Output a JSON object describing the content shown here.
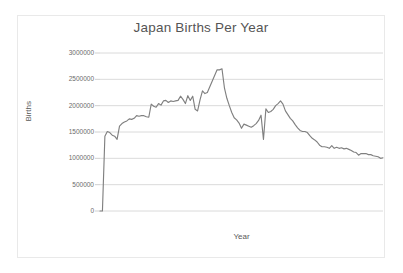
{
  "chart_data": {
    "type": "line",
    "title": "Japan Births Per Year",
    "xlabel": "Year",
    "ylabel": "Births",
    "ylim": [
      0,
      3000000
    ],
    "xlim": [
      1899,
      2015
    ],
    "grid": true,
    "legend": false,
    "legend_position": "none",
    "y_ticks": [
      0,
      500000,
      1000000,
      1500000,
      2000000,
      2500000,
      3000000
    ],
    "y_tick_labels": [
      "0",
      "500000",
      "1000000",
      "1500000",
      "2000000",
      "2500000",
      "3000000"
    ],
    "x_tick_labels": [],
    "line_color": "#808080",
    "series": [
      {
        "name": "Births",
        "x": [
          1899,
          1900,
          1901,
          1902,
          1903,
          1904,
          1905,
          1906,
          1907,
          1908,
          1909,
          1910,
          1911,
          1912,
          1913,
          1914,
          1915,
          1916,
          1917,
          1918,
          1919,
          1920,
          1921,
          1922,
          1923,
          1924,
          1925,
          1926,
          1927,
          1928,
          1929,
          1930,
          1931,
          1932,
          1933,
          1934,
          1935,
          1936,
          1937,
          1938,
          1939,
          1940,
          1941,
          1942,
          1943,
          1947,
          1948,
          1949,
          1950,
          1951,
          1952,
          1953,
          1954,
          1955,
          1956,
          1957,
          1958,
          1959,
          1960,
          1961,
          1962,
          1963,
          1964,
          1965,
          1966,
          1967,
          1968,
          1969,
          1970,
          1971,
          1972,
          1973,
          1974,
          1975,
          1976,
          1977,
          1978,
          1979,
          1980,
          1981,
          1982,
          1983,
          1984,
          1985,
          1986,
          1987,
          1988,
          1989,
          1990,
          1991,
          1992,
          1993,
          1994,
          1995,
          1996,
          1997,
          1998,
          1999,
          2000,
          2001,
          2002,
          2003,
          2004,
          2005,
          2006,
          2007,
          2008,
          2009,
          2010,
          2011,
          2012,
          2013,
          2014,
          2015
        ],
        "values": [
          0,
          0,
          1420000,
          1510000,
          1490000,
          1440000,
          1420000,
          1360000,
          1610000,
          1660000,
          1690000,
          1710000,
          1750000,
          1740000,
          1760000,
          1810000,
          1800000,
          1810000,
          1810000,
          1790000,
          1780000,
          2030000,
          1990000,
          1970000,
          2040000,
          2010000,
          2090000,
          2100000,
          2060000,
          2090000,
          2080000,
          2090000,
          2100000,
          2180000,
          2120000,
          2040000,
          2190000,
          2100000,
          2180000,
          1930000,
          1900000,
          2110000,
          2280000,
          2230000,
          2250000,
          2680000,
          2680000,
          2700000,
          2340000,
          2140000,
          2000000,
          1870000,
          1770000,
          1730000,
          1670000,
          1570000,
          1650000,
          1630000,
          1610000,
          1590000,
          1620000,
          1660000,
          1720000,
          1820000,
          1360000,
          1940000,
          1870000,
          1890000,
          1930000,
          2000000,
          2040000,
          2090000,
          2030000,
          1900000,
          1830000,
          1760000,
          1710000,
          1640000,
          1580000,
          1530000,
          1510000,
          1510000,
          1490000,
          1430000,
          1380000,
          1350000,
          1310000,
          1250000,
          1220000,
          1220000,
          1210000,
          1190000,
          1240000,
          1190000,
          1210000,
          1190000,
          1200000,
          1180000,
          1190000,
          1170000,
          1150000,
          1120000,
          1110000,
          1060000,
          1090000,
          1090000,
          1090000,
          1070000,
          1070000,
          1050000,
          1040000,
          1030000,
          1000000,
          1010000
        ]
      }
    ]
  },
  "chart": {
    "title": "Japan Births Per Year",
    "y_axis_title": "Births",
    "x_axis_title": "Year",
    "y_tick_labels": [
      "3000000",
      "2500000",
      "2000000",
      "1500000",
      "1000000",
      "500000",
      "0"
    ]
  }
}
